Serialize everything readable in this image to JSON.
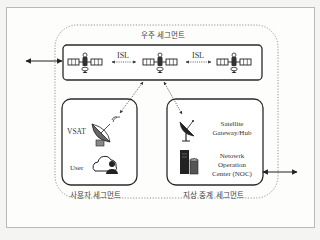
{
  "diagram": {
    "space_segment": {
      "label": "우주 세그먼트",
      "satellites": [
        "satellite-1",
        "satellite-2",
        "satellite-3"
      ],
      "links": [
        {
          "label": "ISL",
          "from": "satellite-1",
          "to": "satellite-2"
        },
        {
          "label": "ISL",
          "from": "satellite-2",
          "to": "satellite-3"
        }
      ]
    },
    "user_segment": {
      "label": "사용자 세그먼트",
      "items": [
        {
          "label": "VSAT",
          "icon": "satellite-dish-icon"
        },
        {
          "label": "User",
          "icon": "cloud-user-icon"
        }
      ]
    },
    "ground_segment": {
      "label": "지상 중계 세그먼트",
      "items": [
        {
          "label_line1": "Satellite",
          "label_line2": "Gateway/Hub",
          "icon": "satellite-dish-icon"
        },
        {
          "label_line1": "Netowrk",
          "label_line2": "Operation",
          "label_line3": "Center (NOC)",
          "icon": "server-database-icon"
        }
      ]
    },
    "colors": {
      "stroke": "#2a2a2a",
      "dashed": "#777777",
      "frame": "#b9b9b6"
    }
  }
}
